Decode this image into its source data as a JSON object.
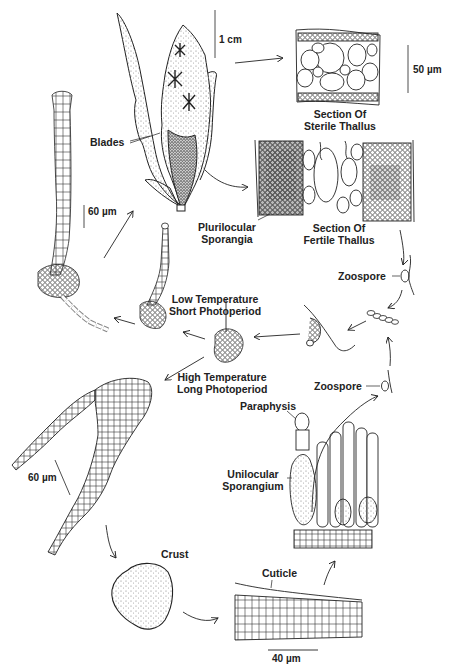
{
  "figure": {
    "labels": {
      "blades": "Blades",
      "sterile_section_line1": "Section Of",
      "sterile_section_line2": "Sterile Thallus",
      "fertile_section_line1": "Section Of",
      "fertile_section_line2": "Fertile Thallus",
      "plurilocular_line1": "Plurilocular",
      "plurilocular_line2": "Sporangia",
      "zoospore_upper": "Zoospore",
      "zoospore_lower": "Zoospore",
      "low_temp_line1": "Low Temperature",
      "low_temp_line2": "Short Photoperiod",
      "high_temp_line1": "High Temperature",
      "high_temp_line2": "Long Photoperiod",
      "paraphysis": "Paraphysis",
      "unilocular_line1": "Unilocular",
      "unilocular_line2": "Sporangium",
      "crust": "Crust",
      "cuticle": "Cuticle"
    },
    "scale_bars": {
      "blade": "1 cm",
      "sterile_section": "50 µm",
      "filament": "60 µm",
      "crust_filament": "60 µm",
      "cuticle_section": "40 µm"
    },
    "colors": {
      "ink": "#222222",
      "stipple": "#8a8a8a",
      "background": "#ffffff"
    }
  }
}
